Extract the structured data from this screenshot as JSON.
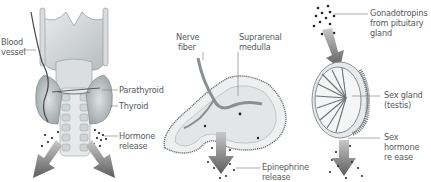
{
  "diagram": {
    "panels": [
      {
        "id": "thyroid",
        "labels": {
          "blood_vessel": [
            "Blood",
            "vessel"
          ],
          "parathyroid": "Parathyroid",
          "thyroid": "Thyroid",
          "hormone_release": [
            "Hormone",
            "release"
          ]
        }
      },
      {
        "id": "adrenal",
        "labels": {
          "nerve_fiber": [
            "Nerve",
            "fiber"
          ],
          "suprarenal_medulla": [
            "Suprarenal",
            "medulla"
          ],
          "epinephrine_release": [
            "Epinephrine",
            "release"
          ]
        }
      },
      {
        "id": "gonad",
        "labels": {
          "gonadotropins": [
            "Gonadotropins",
            "from pituitary",
            "gland"
          ],
          "sex_gland": [
            "Sex gland",
            "(testis)"
          ],
          "sex_hormone_release": [
            "Sex",
            "hormone",
            "re ease"
          ]
        }
      }
    ],
    "colors": {
      "arrow": "#6b6b6b",
      "tissue": "#cfd3d4",
      "gland": "#b9c0c2",
      "dots": "#222222",
      "label_text": "#555a5c",
      "leader_line": "#777777"
    }
  }
}
